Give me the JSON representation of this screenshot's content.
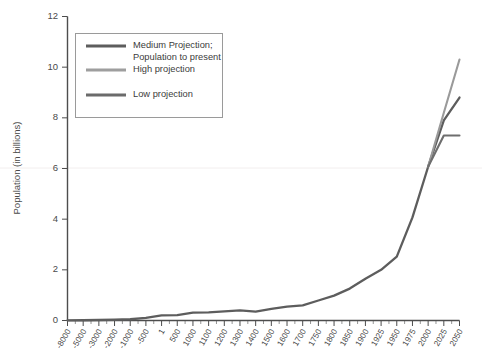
{
  "chart_data": {
    "type": "line",
    "title": "",
    "xlabel": "",
    "ylabel": "Population (in billions)",
    "ylim": [
      0,
      12
    ],
    "yticks": [
      0,
      2,
      4,
      6,
      8,
      10,
      12
    ],
    "grid": false,
    "legend_position": "top-left",
    "categories": [
      "-8000",
      "-5000",
      "-3000",
      "-2000",
      "-1000",
      "-500",
      "1",
      "500",
      "1000",
      "1100",
      "1200",
      "1300",
      "1400",
      "1500",
      "1600",
      "1700",
      "1750",
      "1800",
      "1850",
      "1900",
      "1925",
      "1950",
      "1975",
      "2000",
      "2025",
      "2050"
    ],
    "series": [
      {
        "name": "Medium Projection; Population to present",
        "color": "#5d5d5d",
        "values": [
          0.005,
          0.01,
          0.02,
          0.03,
          0.05,
          0.1,
          0.2,
          0.21,
          0.31,
          0.32,
          0.36,
          0.4,
          0.35,
          0.46,
          0.55,
          0.6,
          0.79,
          0.98,
          1.26,
          1.65,
          2.0,
          2.52,
          4.07,
          6.07,
          7.9,
          8.8
        ]
      },
      {
        "name": "High projection",
        "color": "#9a9a9a",
        "values": [
          null,
          null,
          null,
          null,
          null,
          null,
          null,
          null,
          null,
          null,
          null,
          null,
          null,
          null,
          null,
          null,
          null,
          null,
          null,
          null,
          null,
          null,
          null,
          6.07,
          8.2,
          10.3
        ]
      },
      {
        "name": "Low projection",
        "color": "#6e6e6e",
        "values": [
          null,
          null,
          null,
          null,
          null,
          null,
          null,
          null,
          null,
          null,
          null,
          null,
          null,
          null,
          null,
          null,
          null,
          null,
          null,
          null,
          null,
          null,
          null,
          6.07,
          7.3,
          7.3
        ]
      }
    ]
  },
  "legend": {
    "items": [
      {
        "label_line1": "Medium Projection;",
        "label_line2": "Population to present",
        "color": "#5d5d5d"
      },
      {
        "label_line1": "High projection",
        "label_line2": "",
        "color": "#9e9e9e"
      },
      {
        "label_line1": "Low projection",
        "label_line2": "",
        "color": "#6b6b6b"
      }
    ]
  },
  "axes": {
    "y_axis_title": "Population (in billions)"
  }
}
